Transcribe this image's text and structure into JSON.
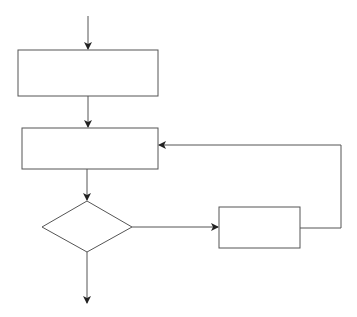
{
  "diagram": {
    "type": "flowchart",
    "stroke_color": "#555555",
    "fill_color": "#ffffff",
    "nodes": [
      {
        "id": "process-1",
        "shape": "rectangle",
        "label": ""
      },
      {
        "id": "process-2",
        "shape": "rectangle",
        "label": ""
      },
      {
        "id": "decision",
        "shape": "diamond",
        "label": ""
      },
      {
        "id": "process-3",
        "shape": "rectangle",
        "label": ""
      }
    ],
    "edges": [
      {
        "from": "start",
        "to": "process-1"
      },
      {
        "from": "process-1",
        "to": "process-2"
      },
      {
        "from": "process-2",
        "to": "decision"
      },
      {
        "from": "decision",
        "to": "process-3"
      },
      {
        "from": "process-3",
        "to": "process-2",
        "kind": "loop-back"
      },
      {
        "from": "decision",
        "to": "end"
      }
    ]
  }
}
